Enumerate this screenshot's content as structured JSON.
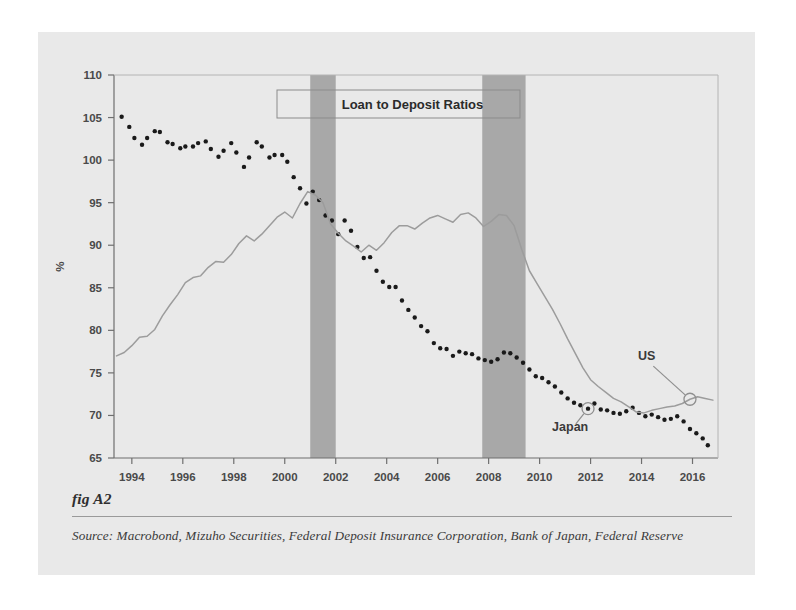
{
  "figure": {
    "caption_label": "fig A2",
    "source_text": "Source:  Macrobond, Mizuho Securities, Federal Deposit Insurance Corporation, Bank of Japan, Federal Reserve",
    "panel_bg": "#e9e9e9",
    "page_bg": "#ffffff"
  },
  "chart_data": {
    "type": "line",
    "title": "Loan to Deposit Ratios",
    "xlabel": "",
    "ylabel": "%",
    "xlim": [
      1993.3,
      1993.3
    ],
    "x_range": [
      1993.3,
      2017.0
    ],
    "ylim": [
      65,
      110
    ],
    "y_ticks": [
      65,
      70,
      75,
      80,
      85,
      90,
      95,
      100,
      105,
      110
    ],
    "x_ticks": [
      1994,
      1996,
      1998,
      2000,
      2002,
      2004,
      2006,
      2008,
      2010,
      2012,
      2014,
      2016
    ],
    "grid": false,
    "legend_position": "in-plot-annotations",
    "colors": {
      "japan": "#1a1a1a",
      "us": "#9c9c9c",
      "recession_band": "#a8a8a8",
      "axis": "#6f6f6f",
      "title_box_border": "#8b8b8b"
    },
    "annotations": [
      {
        "label": "US",
        "x": 2014.2,
        "y": 76.5,
        "marker_x": 2015.9,
        "marker_y": 71.9
      },
      {
        "label": "Japan",
        "x": 2011.2,
        "y": 68.2,
        "marker_x": 2011.9,
        "marker_y": 70.8
      }
    ],
    "recession_bands": [
      {
        "start": 2001.0,
        "end": 2002.0
      },
      {
        "start": 2007.75,
        "end": 2009.45
      }
    ],
    "series": [
      {
        "name": "Japan",
        "style": "dotted-markers",
        "color": "#1a1a1a",
        "x": [
          1993.6,
          1993.9,
          1994.1,
          1994.4,
          1994.6,
          1994.9,
          1995.1,
          1995.4,
          1995.6,
          1995.9,
          1996.1,
          1996.4,
          1996.6,
          1996.9,
          1997.1,
          1997.4,
          1997.6,
          1997.9,
          1998.1,
          1998.4,
          1998.6,
          1998.9,
          1999.1,
          1999.4,
          1999.6,
          1999.9,
          2000.1,
          2000.35,
          2000.6,
          2000.85,
          2001.1,
          2001.35,
          2001.6,
          2001.85,
          2002.1,
          2002.35,
          2002.6,
          2002.85,
          2003.1,
          2003.35,
          2003.6,
          2003.85,
          2004.1,
          2004.35,
          2004.6,
          2004.85,
          2005.1,
          2005.35,
          2005.6,
          2005.85,
          2006.1,
          2006.35,
          2006.6,
          2006.85,
          2007.1,
          2007.35,
          2007.6,
          2007.85,
          2008.1,
          2008.35,
          2008.6,
          2008.85,
          2009.1,
          2009.35,
          2009.6,
          2009.85,
          2010.1,
          2010.35,
          2010.6,
          2010.85,
          2011.1,
          2011.35,
          2011.6,
          2011.9,
          2012.15,
          2012.4,
          2012.65,
          2012.9,
          2013.15,
          2013.4,
          2013.65,
          2013.9,
          2014.15,
          2014.4,
          2014.65,
          2014.9,
          2015.15,
          2015.4,
          2015.65,
          2015.9,
          2016.15,
          2016.4,
          2016.6
        ],
        "y": [
          105.1,
          103.9,
          102.6,
          101.8,
          102.6,
          103.4,
          103.3,
          102.1,
          101.9,
          101.4,
          101.6,
          101.6,
          102.0,
          102.2,
          101.3,
          100.4,
          101.1,
          102.0,
          100.9,
          99.2,
          100.3,
          102.1,
          101.6,
          100.3,
          100.6,
          100.6,
          99.8,
          98.0,
          96.7,
          94.9,
          96.3,
          95.3,
          93.5,
          92.9,
          91.3,
          92.9,
          91.7,
          89.8,
          88.5,
          88.6,
          87.0,
          85.7,
          85.1,
          85.1,
          83.5,
          82.4,
          81.5,
          80.5,
          79.9,
          78.5,
          77.9,
          77.8,
          77.0,
          77.5,
          77.3,
          77.2,
          76.7,
          76.5,
          76.3,
          76.6,
          77.4,
          77.3,
          76.8,
          76.2,
          75.4,
          74.6,
          74.4,
          73.9,
          73.4,
          72.7,
          72.0,
          71.5,
          71.2,
          70.8,
          71.4,
          70.7,
          70.6,
          70.3,
          70.2,
          70.5,
          70.9,
          70.3,
          69.9,
          70.1,
          69.8,
          69.5,
          69.6,
          69.9,
          69.3,
          68.4,
          67.9,
          67.3,
          66.5
        ]
      },
      {
        "name": "US",
        "style": "line",
        "color": "#9c9c9c",
        "x": [
          1993.4,
          1993.7,
          1994.0,
          1994.3,
          1994.6,
          1994.9,
          1995.2,
          1995.5,
          1995.8,
          1996.1,
          1996.4,
          1996.7,
          1997.0,
          1997.3,
          1997.6,
          1997.9,
          1998.2,
          1998.5,
          1998.8,
          1999.1,
          1999.4,
          1999.7,
          2000.0,
          2000.3,
          2000.6,
          2000.9,
          2001.2,
          2001.5,
          2001.8,
          2002.1,
          2002.4,
          2002.7,
          2003.0,
          2003.3,
          2003.6,
          2003.9,
          2004.2,
          2004.5,
          2004.8,
          2005.1,
          2005.4,
          2005.7,
          2006.0,
          2006.3,
          2006.6,
          2006.9,
          2007.2,
          2007.5,
          2007.8,
          2008.1,
          2008.4,
          2008.7,
          2009.0,
          2009.3,
          2009.6,
          2009.9,
          2010.2,
          2010.5,
          2010.8,
          2011.1,
          2011.4,
          2011.7,
          2012.0,
          2012.3,
          2012.6,
          2012.9,
          2013.2,
          2013.5,
          2013.8,
          2014.1,
          2014.4,
          2014.7,
          2015.0,
          2015.3,
          2015.6,
          2015.9,
          2016.2,
          2016.5,
          2016.8
        ],
        "y": [
          77.0,
          77.4,
          78.2,
          79.2,
          79.3,
          80.1,
          81.7,
          83.0,
          84.2,
          85.6,
          86.2,
          86.4,
          87.4,
          88.1,
          88.0,
          88.9,
          90.2,
          91.1,
          90.5,
          91.3,
          92.3,
          93.3,
          93.9,
          93.2,
          94.9,
          96.3,
          95.9,
          95.0,
          92.5,
          91.4,
          90.5,
          89.9,
          89.2,
          90.0,
          89.4,
          90.3,
          91.5,
          92.3,
          92.3,
          91.9,
          92.6,
          93.2,
          93.5,
          93.1,
          92.7,
          93.6,
          93.8,
          93.2,
          92.2,
          92.8,
          93.6,
          93.5,
          92.3,
          89.5,
          87.0,
          85.5,
          84.0,
          82.5,
          80.8,
          79.0,
          77.3,
          75.6,
          74.2,
          73.4,
          72.7,
          72.0,
          71.6,
          71.0,
          70.4,
          70.3,
          70.6,
          70.8,
          71.0,
          71.1,
          71.4,
          71.9,
          72.2,
          72.0,
          71.8
        ]
      }
    ]
  }
}
